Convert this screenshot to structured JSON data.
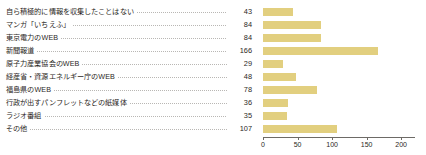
{
  "chart_data": {
    "type": "bar",
    "orientation": "horizontal",
    "title": "",
    "xlabel": "",
    "ylabel": "",
    "xlim": [
      0,
      220
    ],
    "grid": false,
    "legend": null,
    "xticks": [
      0,
      50,
      100,
      150,
      200
    ],
    "xtick_labels": [
      "0",
      "50",
      "100",
      "150",
      "200"
    ],
    "bar_color": "#e2cf7f",
    "axis_color": "#6d6a66",
    "categories": [
      "自ら積極的に情報を収集したことはない",
      "マンガ「いちえふ」",
      "東京電力のWEB",
      "新聞報道",
      "原子力産業協会のWEB",
      "経産省・資源エネルギー庁のWEB",
      "福島県のWEB",
      "行政が出すパンフレットなどの紙媒体",
      "ラジオ番組",
      "その他"
    ],
    "values": [
      43,
      84,
      84,
      166,
      29,
      48,
      78,
      36,
      35,
      107
    ],
    "value_labels": [
      "43",
      "84",
      "84",
      "166",
      "29",
      "48",
      "78",
      "36",
      "35",
      "107"
    ]
  }
}
